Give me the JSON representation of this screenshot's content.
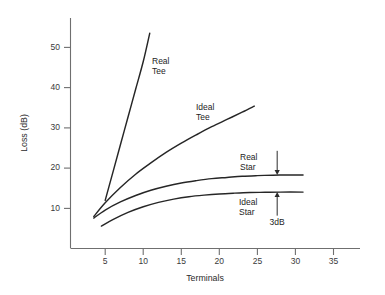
{
  "chart_data": {
    "type": "line",
    "title": "",
    "xlabel": "Terminals",
    "ylabel": "Loss (dB)",
    "xlim": [
      0,
      38
    ],
    "ylim": [
      0,
      58
    ],
    "xticks": [
      5,
      10,
      15,
      20,
      25,
      30,
      35
    ],
    "yticks": [
      10,
      20,
      30,
      40,
      50
    ],
    "grid": false,
    "legend": "inline-labels",
    "series": [
      {
        "name": "Real Tee",
        "label": "Real\nTee",
        "label_line1": "Real",
        "label_line2": "Tee",
        "points": [
          [
            5.0,
            12.0
          ],
          [
            6.0,
            18.9
          ],
          [
            7.0,
            25.8
          ],
          [
            8.0,
            32.7
          ],
          [
            9.0,
            39.6
          ],
          [
            10.0,
            46.5
          ],
          [
            10.85,
            53.5
          ]
        ]
      },
      {
        "name": "Ideal Tee",
        "label_line1": "Ideal",
        "label_line2": "Tee",
        "points": [
          [
            3.5,
            8.0
          ],
          [
            5.0,
            11.4
          ],
          [
            7.0,
            15.2
          ],
          [
            9.0,
            18.5
          ],
          [
            11.0,
            21.3
          ],
          [
            13.0,
            23.9
          ],
          [
            15.0,
            26.2
          ],
          [
            17.0,
            28.3
          ],
          [
            19.0,
            30.3
          ],
          [
            21.0,
            32.1
          ],
          [
            23.0,
            33.9
          ],
          [
            24.6,
            35.4
          ]
        ]
      },
      {
        "name": "Real Star",
        "label_line1": "Real",
        "label_line2": "Star",
        "points": [
          [
            3.5,
            7.6
          ],
          [
            5.0,
            9.6
          ],
          [
            7.0,
            11.6
          ],
          [
            9.0,
            13.2
          ],
          [
            11.0,
            14.5
          ],
          [
            13.0,
            15.5
          ],
          [
            15.0,
            16.3
          ],
          [
            17.0,
            16.9
          ],
          [
            19.0,
            17.4
          ],
          [
            21.0,
            17.7
          ],
          [
            23.0,
            18.0
          ],
          [
            25.0,
            18.15
          ],
          [
            27.0,
            18.25
          ],
          [
            29.0,
            18.3
          ],
          [
            31.0,
            18.3
          ]
        ]
      },
      {
        "name": "Ideal Star",
        "label_line1": "Ideal",
        "label_line2": "Star",
        "points": [
          [
            4.5,
            5.6
          ],
          [
            6.0,
            7.2
          ],
          [
            8.0,
            9.0
          ],
          [
            10.0,
            10.4
          ],
          [
            12.0,
            11.5
          ],
          [
            14.0,
            12.3
          ],
          [
            16.0,
            12.9
          ],
          [
            18.0,
            13.3
          ],
          [
            20.0,
            13.6
          ],
          [
            22.0,
            13.8
          ],
          [
            24.0,
            13.95
          ],
          [
            26.0,
            14.0
          ],
          [
            28.0,
            14.05
          ],
          [
            31.0,
            14.05
          ]
        ]
      }
    ],
    "annotations": [
      {
        "name": "3dB-gap",
        "label": "3dB",
        "x": 27.6,
        "y_top": 18.3,
        "y_bottom": 14.05,
        "arrow_top_from": 24.3,
        "arrow_bottom_from": 8.2
      }
    ]
  },
  "colors": {
    "curve": "#262626",
    "axis": "#6f6f6f",
    "text": "#1d1d1d",
    "background": "#ffffff"
  }
}
